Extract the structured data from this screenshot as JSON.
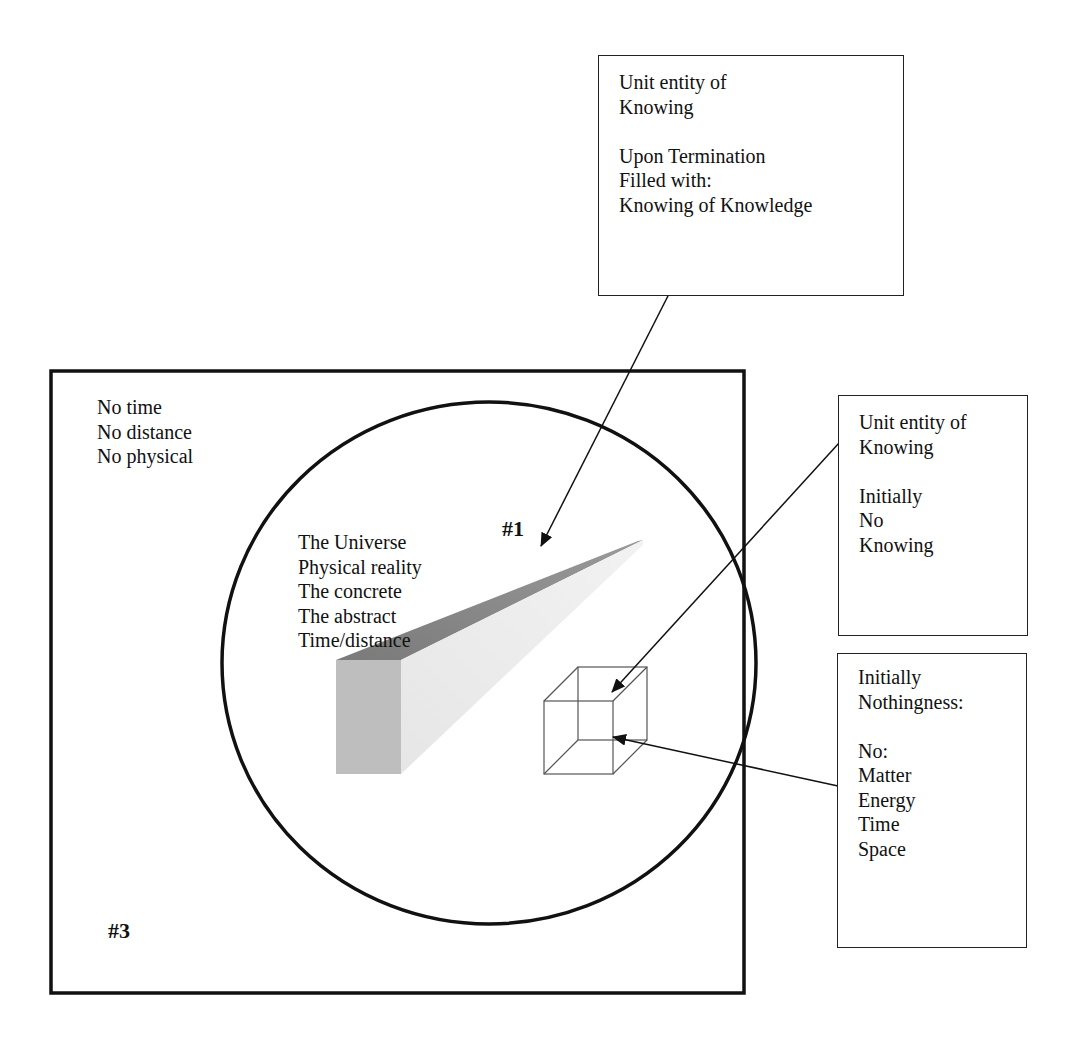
{
  "outer_region": {
    "label_lines": "No time\nNo distance\nNo physical",
    "marker": "#3"
  },
  "universe_circle": {
    "label_lines": "The Universe\nPhysical reality\nThe concrete\nThe abstract\nTime/distance",
    "marker": "#1"
  },
  "callouts": [
    {
      "id": "termination",
      "text": "Unit entity of\nKnowing\n\nUpon Termination\nFilled with:\nKnowing of Knowledge",
      "points_to": "prism"
    },
    {
      "id": "initial-knowing",
      "text": "Unit entity of\nKnowing\n\nInitially\nNo\nKnowing",
      "points_to": "cube"
    },
    {
      "id": "nothingness",
      "text": "Initially\nNothingness:\n\nNo:\nMatter\nEnergy\nTime\nSpace",
      "points_to": "cube-interior"
    }
  ],
  "colors": {
    "line": "#111111",
    "prism_top": "#7d7d7d",
    "prism_side": "#e2e2e2",
    "prism_front": "#bdbdbd",
    "cube_line": "#555555"
  }
}
